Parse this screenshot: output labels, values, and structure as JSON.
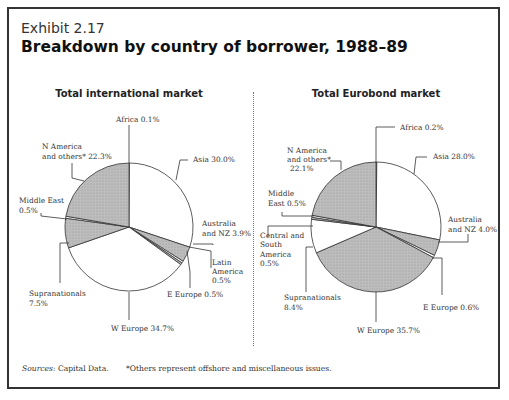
{
  "exhibit_label": "Exhibit 2.17",
  "title": "Breakdown by country of borrower, 1988–89",
  "footer": {
    "source_label": "Sources",
    "source_text": ": Capital Data.",
    "note": "*Others represent offshore and miscellaneous issues."
  },
  "colors": {
    "shaded": "#b8b8b8",
    "unshaded": "#ffffff",
    "stroke": "#333333"
  },
  "chart_data": [
    {
      "type": "pie",
      "title": "Total international market",
      "start_angle": "12 o'clock, clockwise",
      "slices": [
        {
          "label": "Africa",
          "value": 0.1,
          "text": "Africa 0.1%",
          "shaded": false
        },
        {
          "label": "Asia",
          "value": 30.0,
          "text": "Asia 30.0%",
          "shaded": false
        },
        {
          "label": "Australia and NZ",
          "value": 3.9,
          "text": "Australia and NZ 3.9%",
          "shaded": true
        },
        {
          "label": "Latin America",
          "value": 0.5,
          "text": "Latin America 0.5%",
          "shaded": false
        },
        {
          "label": "E Europe",
          "value": 0.5,
          "text": "E Europe 0.5%",
          "shaded": true
        },
        {
          "label": "W Europe",
          "value": 34.7,
          "text": "W Europe 34.7%",
          "shaded": false
        },
        {
          "label": "Supranationals",
          "value": 7.5,
          "text": "Supranationals 7.5%",
          "shaded": true
        },
        {
          "label": "Middle East",
          "value": 0.5,
          "text": "Middle East 0.5%",
          "shaded": false
        },
        {
          "label": "N America and others*",
          "value": 22.3,
          "text": "N America and others* 22.3%",
          "shaded": true
        }
      ]
    },
    {
      "type": "pie",
      "title": "Total Eurobond market",
      "start_angle": "12 o'clock, clockwise",
      "slices": [
        {
          "label": "Africa",
          "value": 0.2,
          "text": "Africa 0.2%",
          "shaded": false
        },
        {
          "label": "Asia",
          "value": 28.0,
          "text": "Asia 28.0%",
          "shaded": false
        },
        {
          "label": "Australia and NZ",
          "value": 4.0,
          "text": "Australia and NZ 4.0%",
          "shaded": true
        },
        {
          "label": "E Europe",
          "value": 0.6,
          "text": "E Europe 0.6%",
          "shaded": false
        },
        {
          "label": "W Europe",
          "value": 35.7,
          "text": "W Europe 35.7%",
          "shaded": true
        },
        {
          "label": "Supranationals",
          "value": 8.4,
          "text": "Supranationals 8.4%",
          "shaded": false
        },
        {
          "label": "Central and South America",
          "value": 0.5,
          "text": "Central and South America 0.5%",
          "shaded": true
        },
        {
          "label": "Middle East",
          "value": 0.5,
          "text": "Middle East 0.5%",
          "shaded": false
        },
        {
          "label": "N America and others*",
          "value": 22.1,
          "text": "N America and others* 22.1%",
          "shaded": true
        }
      ]
    }
  ],
  "labels_left": {
    "africa": "Africa 0.1%",
    "nam1": "N America",
    "nam2": "and others* 22.3%",
    "asia": "Asia 30.0%",
    "me1": "Middle East",
    "me2": "0.5%",
    "aus1": "Australia",
    "aus2": "and NZ 3.9%",
    "lat1": "Latin",
    "lat2": "America",
    "lat3": "0.5%",
    "supra1": "Supranationals",
    "supra2": "7.5%",
    "eeur": "E Europe 0.5%",
    "weur": "W Europe 34.7%"
  },
  "labels_right": {
    "africa": "Africa 0.2%",
    "nam1": "N America",
    "nam2": "and others*",
    "nam3": "22.1%",
    "asia": "Asia 28.0%",
    "me1": "Middle",
    "me2": "East 0.5%",
    "aus1": "Australia",
    "aus2": "and NZ 4.0%",
    "cs1": "Central and",
    "cs2": "South",
    "cs3": "America",
    "cs4": "0.5%",
    "supra1": "Supranationals",
    "supra2": "8.4%",
    "eeur": "E Europe 0.6%",
    "weur": "W Europe 35.7%"
  }
}
